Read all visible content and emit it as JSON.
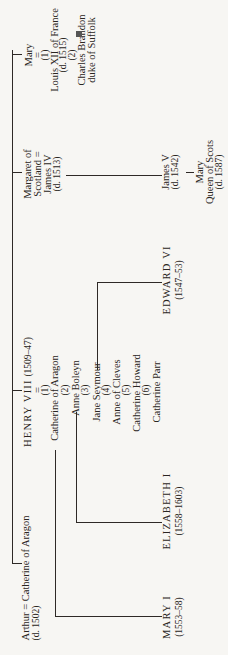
{
  "nodes": {
    "mary_tudor": {
      "name": "Mary",
      "eq": "=",
      "n1": "(1)",
      "spouse1": "Louis XII of France",
      "spouse1_death": "(d. 1515)",
      "n2": "(2)",
      "spouse2": "Charles Brandon",
      "spouse2_title": "duke of Suffolk",
      "bracket": "]"
    },
    "margaret": {
      "line1": "Margaret of",
      "line2": "Scotland =",
      "line3": "James IV",
      "line4": "(d. 1513)"
    },
    "james_v": {
      "name": "James V",
      "death": "(d. 1542)"
    },
    "mary_qos": {
      "name": "Mary",
      "title": "Queen of Scots",
      "death": "(d. 1587)"
    },
    "henry_viii": {
      "name": "HENRY VIII",
      "reign": "(1509–47)",
      "eq": "="
    },
    "wives": [
      {
        "num": "(1)",
        "name": "Catherine of Aragon"
      },
      {
        "num": "(2)",
        "name": "Anne Boleyn"
      },
      {
        "num": "(3)",
        "name": "Jane Seymour"
      },
      {
        "num": "(4)",
        "name": "Anne of Cleves"
      },
      {
        "num": "(5)",
        "name": "Catherine Howard"
      },
      {
        "num": "(6)",
        "name": "Catherine Parr"
      }
    ],
    "arthur": {
      "line1": "Arthur = Catherine of Aragon",
      "line2": "(d. 1502)"
    },
    "mary_i": {
      "name": "MARY I",
      "reign": "(1553–58)"
    },
    "elizabeth_i": {
      "name": "ELIZABETH I",
      "reign": "(1558–1603)"
    },
    "edward_vi": {
      "name": "EDWARD VI",
      "reign": "(1547–53)"
    }
  }
}
